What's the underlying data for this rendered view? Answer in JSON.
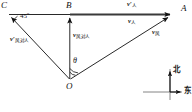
{
  "figure": {
    "type": "vector-diagram",
    "points": {
      "C": "C",
      "B": "B",
      "A": "A",
      "O": "O"
    },
    "angles": {
      "at_C": "45º",
      "at_O": "θ",
      "right_angle_at_O": "90°"
    },
    "vectors": [
      {
        "name": "v-prime-person",
        "symbol": "v",
        "prime": "′",
        "subscript": "人",
        "position": "above-line-right"
      },
      {
        "name": "v-person",
        "symbol": "v",
        "prime": "",
        "subscript": "人",
        "position": "below-line-right"
      },
      {
        "name": "v-wind",
        "symbol": "v",
        "prime": "",
        "subscript": "风",
        "position": "along-OA"
      },
      {
        "name": "v-prime-wind-rel-person",
        "symbol": "v",
        "prime": "′",
        "subscript": "风对人",
        "position": "along-OC"
      },
      {
        "name": "v-wind-rel-person",
        "symbol": "v",
        "prime": "",
        "subscript": "风对人",
        "position": "along-OB"
      }
    ],
    "compass": {
      "north": "北",
      "east": "东"
    },
    "colors": {
      "stroke": "#111111",
      "background": "#ffffff",
      "thick_line": "#3a3a3a"
    }
  }
}
